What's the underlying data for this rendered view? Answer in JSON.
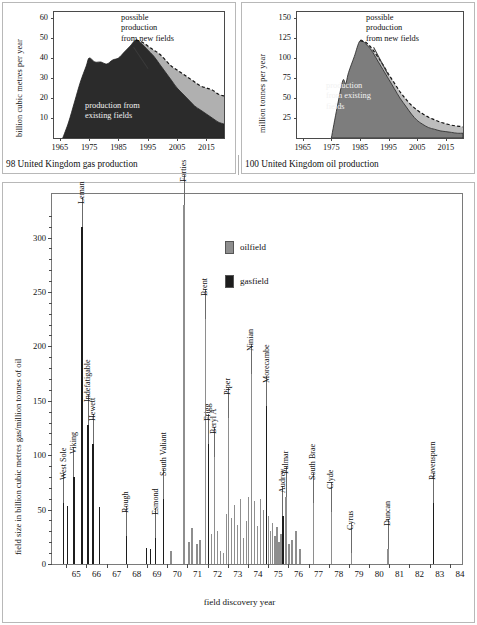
{
  "gas_panel": {
    "caption": "98  United Kingdom gas production",
    "chart_data": {
      "type": "area",
      "title": "United Kingdom gas production",
      "ylabel": "billion cubic metres per year",
      "xlabel": "",
      "ylim": [
        0,
        63
      ],
      "xlim": [
        1963,
        2021
      ],
      "yticks": [
        10,
        20,
        30,
        40,
        50,
        60
      ],
      "xticks": [
        1965,
        1975,
        1985,
        1995,
        2005,
        2015
      ],
      "grid": false,
      "annotations": [
        {
          "text": "possible\nproduction\nfrom new fields",
          "target_year": 2003
        },
        {
          "text": "production from\nexisting fields",
          "inside": true
        }
      ],
      "series": [
        {
          "name": "production from existing fields",
          "color": "#2b2b2b",
          "x": [
            1966,
            1968,
            1970,
            1972,
            1974,
            1975,
            1977,
            1979,
            1981,
            1983,
            1985,
            1987,
            1989,
            1991,
            1993,
            1995,
            1997,
            1999,
            2001,
            2003,
            2005,
            2007,
            2009,
            2011,
            2013,
            2015,
            2017,
            2019,
            2021
          ],
          "values": [
            0,
            8,
            18,
            28,
            36,
            40,
            38,
            38,
            37,
            39,
            40,
            43,
            46,
            49,
            47,
            44,
            41,
            37,
            33,
            29,
            25,
            22,
            19,
            16,
            14,
            12,
            10,
            8,
            7
          ]
        },
        {
          "name": "total including possible production from new fields",
          "color": "#b0b0b0",
          "x": [
            1991,
            1993,
            1995,
            1997,
            1999,
            2001,
            2003,
            2005,
            2007,
            2009,
            2011,
            2013,
            2015,
            2017,
            2019,
            2021
          ],
          "values": [
            49,
            48,
            46,
            44,
            42,
            39,
            36,
            34,
            32,
            30,
            28,
            26,
            25,
            24,
            22,
            21
          ]
        }
      ]
    }
  },
  "oil_panel": {
    "caption": "100  United Kingdom oil production",
    "chart_data": {
      "type": "area",
      "title": "United Kingdom oil production",
      "ylabel": "million tonnes per year",
      "xlabel": "",
      "ylim": [
        0,
        158
      ],
      "xlim": [
        1963,
        2021
      ],
      "yticks": [
        25,
        50,
        75,
        100,
        125,
        150
      ],
      "xticks": [
        1965,
        1975,
        1985,
        1995,
        2005,
        2015
      ],
      "grid": false,
      "annotations": [
        {
          "text": "possible\nproduction\nfrom new fields",
          "target_year": 2001
        },
        {
          "text": "production\nfrom existing\nfields",
          "inside": true
        }
      ],
      "series": [
        {
          "name": "production from existing fields",
          "color": "#7d7d7d",
          "x": [
            1975,
            1977,
            1979,
            1980,
            1981,
            1983,
            1985,
            1987,
            1989,
            1991,
            1993,
            1995,
            1997,
            1999,
            2001,
            2003,
            2005,
            2007,
            2009,
            2011,
            2013,
            2015,
            2017,
            2019,
            2021
          ],
          "values": [
            0,
            38,
            72,
            68,
            82,
            102,
            122,
            118,
            110,
            98,
            86,
            74,
            62,
            50,
            40,
            30,
            22,
            17,
            13,
            11,
            9,
            8,
            7,
            6,
            6
          ]
        },
        {
          "name": "total including possible production from new fields",
          "color": "#bdbdbd",
          "x": [
            1985,
            1987,
            1989,
            1991,
            1993,
            1995,
            1997,
            1999,
            2001,
            2003,
            2005,
            2007,
            2009,
            2011,
            2013,
            2015,
            2017,
            2019,
            2021
          ],
          "values": [
            122,
            120,
            113,
            103,
            92,
            80,
            69,
            58,
            49,
            41,
            35,
            30,
            26,
            23,
            20,
            18,
            16,
            15,
            14
          ]
        }
      ]
    }
  },
  "field_panel": {
    "chart_data": {
      "type": "bar",
      "title": "",
      "ylabel": "field size in billion cubic metres gas/million tonnes of oil",
      "xlabel": "field discovery year",
      "ylim": [
        0,
        340
      ],
      "yticks": [
        0,
        50,
        100,
        150,
        200,
        250,
        300
      ],
      "xticks": [
        65,
        66,
        67,
        68,
        69,
        70,
        71,
        72,
        73,
        74,
        75,
        76,
        77,
        78,
        79,
        80,
        81,
        82,
        83,
        84
      ],
      "grid": false,
      "legend": [
        {
          "label": "oilfield",
          "color": "#8e8e8e"
        },
        {
          "label": "gasfield",
          "color": "#1c1c1c"
        }
      ],
      "bars": [
        {
          "x": 64.85,
          "value": 56,
          "kind": "gasfield",
          "label": "West Sole"
        },
        {
          "x": 65.05,
          "value": 53,
          "kind": "gasfield"
        },
        {
          "x": 65.35,
          "value": 80,
          "kind": "gasfield",
          "label": "Viking"
        },
        {
          "x": 65.75,
          "value": 310,
          "kind": "gasfield",
          "label": "Leman"
        },
        {
          "x": 66.05,
          "value": 128,
          "kind": "gasfield",
          "label": "Indefatigable"
        },
        {
          "x": 66.3,
          "value": 110,
          "kind": "gasfield",
          "label": "Hewett"
        },
        {
          "x": 66.6,
          "value": 52,
          "kind": "gasfield"
        },
        {
          "x": 67.95,
          "value": 26,
          "kind": "gasfield",
          "label": "Rough"
        },
        {
          "x": 68.95,
          "value": 15,
          "kind": "gasfield"
        },
        {
          "x": 69.15,
          "value": 14,
          "kind": "gasfield"
        },
        {
          "x": 69.4,
          "value": 24,
          "kind": "gasfield",
          "label": "Esmond"
        },
        {
          "x": 69.8,
          "value": 60,
          "kind": "gasfield",
          "label": "South Valiant"
        },
        {
          "x": 70.15,
          "value": 12,
          "kind": "oilfield"
        },
        {
          "x": 70.8,
          "value": 330,
          "kind": "oilfield",
          "label": "Forties"
        },
        {
          "x": 71.05,
          "value": 20,
          "kind": "oilfield"
        },
        {
          "x": 71.2,
          "value": 33,
          "kind": "oilfield"
        },
        {
          "x": 71.45,
          "value": 18,
          "kind": "oilfield"
        },
        {
          "x": 71.6,
          "value": 22,
          "kind": "oilfield"
        },
        {
          "x": 71.85,
          "value": 225,
          "kind": "oilfield",
          "label": "Brent"
        },
        {
          "x": 72.0,
          "value": 110,
          "kind": "gasfield",
          "label": "Frigg"
        },
        {
          "x": 72.15,
          "value": 28,
          "kind": "oilfield"
        },
        {
          "x": 72.3,
          "value": 98,
          "kind": "oilfield",
          "label": "Beryl A"
        },
        {
          "x": 72.45,
          "value": 30,
          "kind": "oilfield"
        },
        {
          "x": 72.6,
          "value": 12,
          "kind": "oilfield"
        },
        {
          "x": 72.75,
          "value": 10,
          "kind": "oilfield"
        },
        {
          "x": 72.9,
          "value": 46,
          "kind": "oilfield"
        },
        {
          "x": 73.0,
          "value": 134,
          "kind": "oilfield",
          "label": "Piper"
        },
        {
          "x": 73.15,
          "value": 42,
          "kind": "oilfield"
        },
        {
          "x": 73.3,
          "value": 54,
          "kind": "oilfield"
        },
        {
          "x": 73.45,
          "value": 36,
          "kind": "oilfield"
        },
        {
          "x": 73.6,
          "value": 60,
          "kind": "oilfield"
        },
        {
          "x": 73.75,
          "value": 24,
          "kind": "oilfield"
        },
        {
          "x": 73.9,
          "value": 40,
          "kind": "oilfield"
        },
        {
          "x": 74.0,
          "value": 62,
          "kind": "oilfield"
        },
        {
          "x": 74.15,
          "value": 175,
          "kind": "oilfield",
          "label": "Ninian"
        },
        {
          "x": 74.3,
          "value": 58,
          "kind": "oilfield"
        },
        {
          "x": 74.45,
          "value": 35,
          "kind": "oilfield"
        },
        {
          "x": 74.6,
          "value": 60,
          "kind": "oilfield"
        },
        {
          "x": 74.75,
          "value": 50,
          "kind": "oilfield"
        },
        {
          "x": 74.9,
          "value": 145,
          "kind": "gasfield",
          "label": "Morecambe"
        },
        {
          "x": 75.0,
          "value": 44,
          "kind": "oilfield"
        },
        {
          "x": 75.1,
          "value": 30,
          "kind": "oilfield"
        },
        {
          "x": 75.2,
          "value": 38,
          "kind": "oilfield"
        },
        {
          "x": 75.3,
          "value": 26,
          "kind": "oilfield"
        },
        {
          "x": 75.4,
          "value": 34,
          "kind": "oilfield"
        },
        {
          "x": 75.5,
          "value": 20,
          "kind": "oilfield"
        },
        {
          "x": 75.6,
          "value": 28,
          "kind": "oilfield"
        },
        {
          "x": 75.7,
          "value": 44,
          "kind": "gasfield",
          "label": "Audrey"
        },
        {
          "x": 75.85,
          "value": 62,
          "kind": "oilfield",
          "label": "Fulmar"
        },
        {
          "x": 76.0,
          "value": 18,
          "kind": "oilfield"
        },
        {
          "x": 76.15,
          "value": 22,
          "kind": "oilfield"
        },
        {
          "x": 76.35,
          "value": 30,
          "kind": "oilfield"
        },
        {
          "x": 76.55,
          "value": 14,
          "kind": "oilfield"
        },
        {
          "x": 77.2,
          "value": 56,
          "kind": "oilfield",
          "label": "South Brae"
        },
        {
          "x": 78.1,
          "value": 48,
          "kind": "oilfield",
          "label": "Clyde"
        },
        {
          "x": 79.1,
          "value": 10,
          "kind": "oilfield",
          "label": "Cyrus"
        },
        {
          "x": 80.9,
          "value": 14,
          "kind": "oilfield",
          "label": "Duncan"
        },
        {
          "x": 83.15,
          "value": 56,
          "kind": "gasfield",
          "label": "Ravenspurn"
        }
      ]
    }
  }
}
